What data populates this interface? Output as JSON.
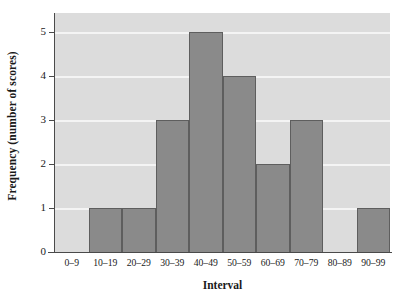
{
  "chart_data": {
    "type": "bar",
    "title": "",
    "subtitle": "",
    "xlabel": "Interval",
    "ylabel": "Frequency  (number of scores)",
    "categories": [
      "0–9",
      "10–19",
      "20–29",
      "30–39",
      "40–49",
      "50–59",
      "60–69",
      "70–79",
      "80–89",
      "90–99"
    ],
    "values": [
      0,
      1,
      1,
      3,
      5,
      4,
      2,
      3,
      0,
      1
    ],
    "series": [
      {
        "name": "Frequency",
        "values": [
          0,
          1,
          1,
          3,
          5,
          4,
          2,
          3,
          0,
          1
        ]
      }
    ],
    "ylim": [
      0,
      5
    ],
    "yticks": [
      0,
      1,
      2,
      3,
      4,
      5
    ],
    "ytick_labels": [
      "0",
      "1",
      "2",
      "3",
      "4",
      "5"
    ],
    "grid": true,
    "grid_axis": "y",
    "legend": false,
    "legend_position": "none",
    "annotations": [],
    "colors": {
      "bar_fill": "#8a8a8a",
      "bar_edge": "#5e5e5e",
      "plot_background": "#dcdcdc",
      "gridline": "#f4f4f4",
      "axis_line": "#4a4a4a",
      "text": "#1a1a1a",
      "page_background": "#ffffff"
    }
  }
}
